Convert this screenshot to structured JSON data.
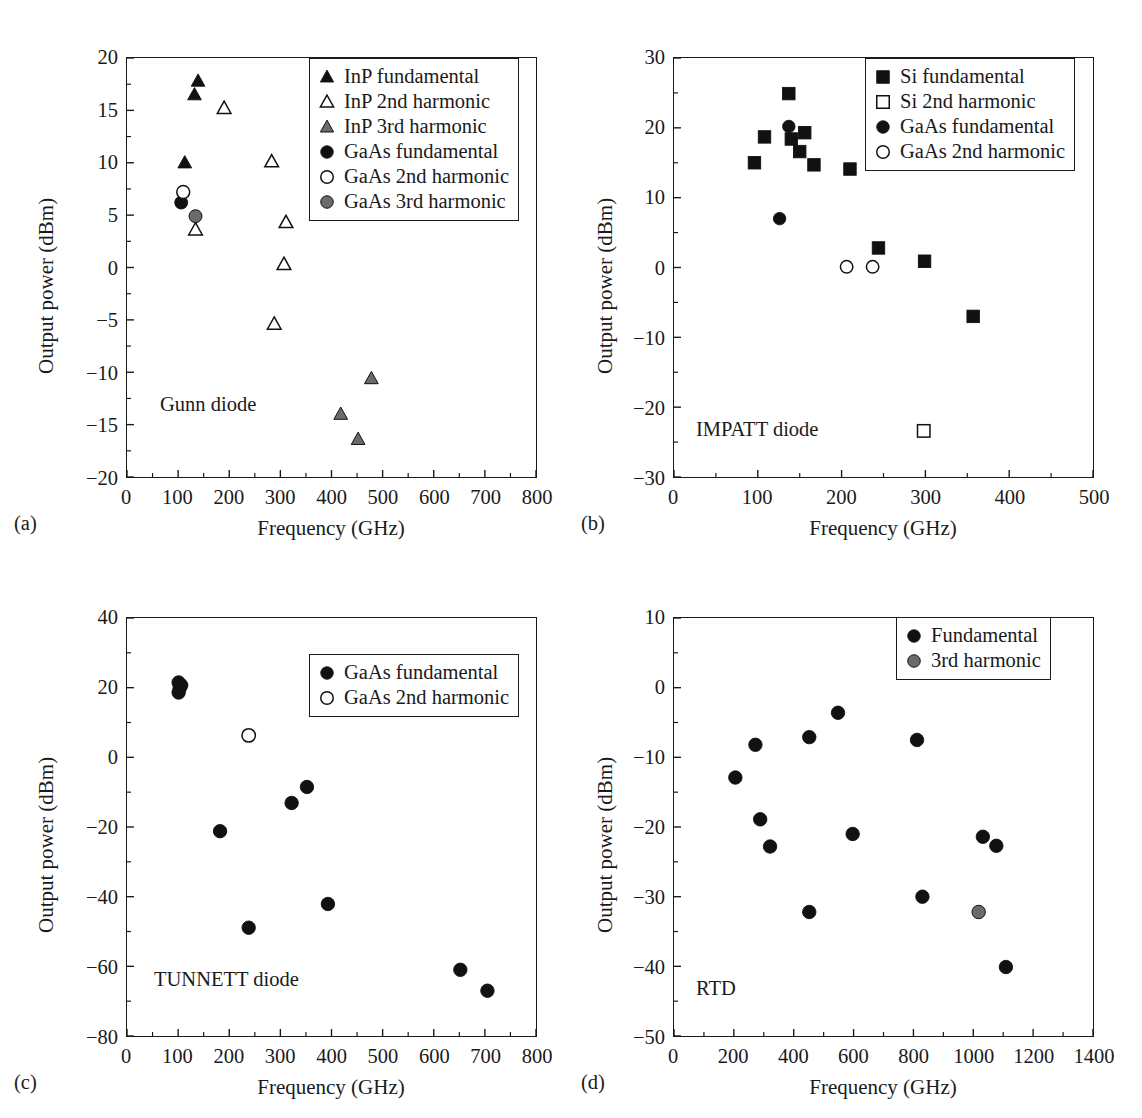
{
  "figure": {
    "colors": {
      "filled": "#111111",
      "open_fill": "#ffffff",
      "open_stroke": "#111111",
      "gray": "#6b6b6b",
      "axis": "#1a1a1a"
    },
    "axis_title_x": "Frequency (GHz)",
    "axis_title_y": "Output power (dBm)"
  },
  "panels": [
    {
      "caption": "(a)",
      "annotation": "Gunn diode",
      "legend": [
        {
          "label": "InP fundamental",
          "marker": "triangle",
          "style": "filled"
        },
        {
          "label": "InP 2nd harmonic",
          "marker": "triangle",
          "style": "open"
        },
        {
          "label": "InP 3rd harmonic",
          "marker": "triangle",
          "style": "gray"
        },
        {
          "label": "GaAs fundamental",
          "marker": "circle",
          "style": "filled"
        },
        {
          "label": "GaAs 2nd harmonic",
          "marker": "circle",
          "style": "open"
        },
        {
          "label": "GaAs 3rd harmonic",
          "marker": "circle",
          "style": "gray"
        }
      ],
      "chart_data": {
        "type": "scatter",
        "title": "Gunn diode",
        "xlabel": "Frequency (GHz)",
        "ylabel": "Output power (dBm)",
        "xlim": [
          0,
          800
        ],
        "ylim": [
          -20,
          20
        ],
        "xticks": [
          0,
          100,
          200,
          300,
          400,
          500,
          600,
          700,
          800
        ],
        "yticks": [
          -20,
          -15,
          -10,
          -5,
          0,
          5,
          10,
          15,
          20
        ],
        "xtick_labels": [
          "0",
          "100",
          "200",
          "300",
          "400",
          "500",
          "600",
          "700",
          "800"
        ],
        "ytick_labels": [
          "−20",
          "−15",
          "−10",
          "−5",
          "0",
          "5",
          "10",
          "15",
          "20"
        ],
        "grid": false,
        "legend_position": "top-right",
        "series": [
          {
            "name": "InP fundamental",
            "marker": "triangle",
            "style": "filled",
            "points": [
              [
                139,
                17.8
              ],
              [
                132,
                16.5
              ],
              [
                113,
                10.0
              ]
            ]
          },
          {
            "name": "InP 2nd harmonic",
            "marker": "triangle",
            "style": "open",
            "points": [
              [
                190,
                15.2
              ],
              [
                283,
                10.1
              ],
              [
                311,
                4.3
              ],
              [
                307,
                0.3
              ],
              [
                288,
                -5.4
              ],
              [
                134,
                3.6
              ]
            ]
          },
          {
            "name": "InP 3rd harmonic",
            "marker": "triangle",
            "style": "gray",
            "points": [
              [
                478,
                -10.6
              ],
              [
                418,
                -14.0
              ],
              [
                452,
                -16.4
              ]
            ]
          },
          {
            "name": "GaAs fundamental",
            "marker": "circle",
            "style": "filled",
            "points": [
              [
                106,
                6.2
              ]
            ]
          },
          {
            "name": "GaAs 2nd harmonic",
            "marker": "circle",
            "style": "open",
            "points": [
              [
                110,
                7.2
              ]
            ]
          },
          {
            "name": "GaAs 3rd harmonic",
            "marker": "circle",
            "style": "gray",
            "points": [
              [
                134,
                4.9
              ]
            ]
          }
        ]
      }
    },
    {
      "caption": "(b)",
      "annotation": "IMPATT diode",
      "legend": [
        {
          "label": "Si fundamental",
          "marker": "square",
          "style": "filled"
        },
        {
          "label": "Si 2nd harmonic",
          "marker": "square",
          "style": "open"
        },
        {
          "label": "GaAs fundamental",
          "marker": "circle",
          "style": "filled"
        },
        {
          "label": "GaAs 2nd harmonic",
          "marker": "circle",
          "style": "open"
        }
      ],
      "chart_data": {
        "type": "scatter",
        "title": "IMPATT diode",
        "xlabel": "Frequency (GHz)",
        "ylabel": "Output power (dBm)",
        "xlim": [
          0,
          500
        ],
        "ylim": [
          -30,
          30
        ],
        "xticks": [
          0,
          100,
          200,
          300,
          400,
          500
        ],
        "yticks": [
          -30,
          -20,
          -10,
          0,
          10,
          20,
          30
        ],
        "xtick_labels": [
          "0",
          "100",
          "200",
          "300",
          "400",
          "500"
        ],
        "ytick_labels": [
          "−30",
          "−20",
          "−10",
          "0",
          "10",
          "20",
          "30"
        ],
        "grid": false,
        "legend_position": "top-right",
        "series": [
          {
            "name": "Si fundamental",
            "marker": "square",
            "style": "filled",
            "points": [
              [
                137,
                24.9
              ],
              [
                108,
                18.7
              ],
              [
                140,
                18.4
              ],
              [
                156,
                19.3
              ],
              [
                150,
                16.6
              ],
              [
                96,
                15.0
              ],
              [
                167,
                14.7
              ],
              [
                210,
                14.1
              ],
              [
                244,
                2.8
              ],
              [
                299,
                0.9
              ],
              [
                357,
                -7.0
              ]
            ]
          },
          {
            "name": "Si 2nd harmonic",
            "marker": "square",
            "style": "open",
            "points": [
              [
                298,
                -23.4
              ]
            ]
          },
          {
            "name": "GaAs fundamental",
            "marker": "circle",
            "style": "filled",
            "points": [
              [
                137,
                20.2
              ],
              [
                126,
                7.0
              ]
            ]
          },
          {
            "name": "GaAs 2nd harmonic",
            "marker": "circle",
            "style": "open",
            "points": [
              [
                206,
                0.1
              ],
              [
                237,
                0.1
              ]
            ]
          }
        ]
      }
    },
    {
      "caption": "(c)",
      "annotation": "TUNNETT diode",
      "legend": [
        {
          "label": "GaAs fundamental",
          "marker": "circle",
          "style": "filled"
        },
        {
          "label": "GaAs 2nd harmonic",
          "marker": "circle",
          "style": "open"
        }
      ],
      "chart_data": {
        "type": "scatter",
        "title": "TUNNETT diode",
        "xlabel": "Frequency (GHz)",
        "ylabel": "Output power (dBm)",
        "xlim": [
          0,
          800
        ],
        "ylim": [
          -80,
          40
        ],
        "xticks": [
          0,
          100,
          200,
          300,
          400,
          500,
          600,
          700,
          800
        ],
        "yticks": [
          -80,
          -60,
          -40,
          -20,
          0,
          20,
          40
        ],
        "xtick_labels": [
          "0",
          "100",
          "200",
          "300",
          "400",
          "500",
          "600",
          "700",
          "800"
        ],
        "ytick_labels": [
          "−80",
          "−60",
          "−40",
          "−20",
          "0",
          "20",
          "40"
        ],
        "grid": false,
        "legend_position": "top-right",
        "series": [
          {
            "name": "GaAs fundamental",
            "marker": "circle",
            "style": "filled",
            "points": [
              [
                101,
                21.5
              ],
              [
                103,
                19.8
              ],
              [
                101,
                18.6
              ],
              [
                106,
                20.7
              ],
              [
                182,
                -21.2
              ],
              [
                322,
                -13.1
              ],
              [
                352,
                -8.5
              ],
              [
                238,
                -48.9
              ],
              [
                393,
                -42.1
              ],
              [
                652,
                -61.0
              ],
              [
                705,
                -67.0
              ]
            ]
          },
          {
            "name": "GaAs 2nd harmonic",
            "marker": "circle",
            "style": "open",
            "points": [
              [
                238,
                6.3
              ]
            ]
          }
        ]
      }
    },
    {
      "caption": "(d)",
      "annotation": "RTD",
      "legend": [
        {
          "label": "Fundamental",
          "marker": "circle",
          "style": "filled"
        },
        {
          "label": "3rd harmonic",
          "marker": "circle",
          "style": "gray"
        }
      ],
      "chart_data": {
        "type": "scatter",
        "title": "RTD",
        "xlabel": "Frequency (GHz)",
        "ylabel": "Output power (dBm)",
        "xlim": [
          0,
          1400
        ],
        "ylim": [
          -50,
          10
        ],
        "xticks": [
          0,
          200,
          400,
          600,
          800,
          1000,
          1200,
          1400
        ],
        "yticks": [
          -50,
          -40,
          -30,
          -20,
          -10,
          0,
          10
        ],
        "xtick_labels": [
          "0",
          "200",
          "400",
          "600",
          "800",
          "1000",
          "1200",
          "1400"
        ],
        "ytick_labels": [
          "−50",
          "−40",
          "−30",
          "−20",
          "−10",
          "0",
          "10"
        ],
        "grid": false,
        "legend_position": "top-right",
        "series": [
          {
            "name": "Fundamental",
            "marker": "circle",
            "style": "filled",
            "points": [
              [
                548,
                -3.6
              ],
              [
                452,
                -7.1
              ],
              [
                812,
                -7.5
              ],
              [
                272,
                -8.2
              ],
              [
                205,
                -12.9
              ],
              [
                288,
                -18.9
              ],
              [
                597,
                -21.0
              ],
              [
                1032,
                -21.4
              ],
              [
                1077,
                -22.7
              ],
              [
                321,
                -22.8
              ],
              [
                830,
                -30.0
              ],
              [
                452,
                -32.2
              ],
              [
                1109,
                -40.1
              ]
            ]
          },
          {
            "name": "3rd harmonic",
            "marker": "circle",
            "style": "gray",
            "points": [
              [
                1018,
                -32.2
              ]
            ]
          }
        ]
      }
    }
  ]
}
